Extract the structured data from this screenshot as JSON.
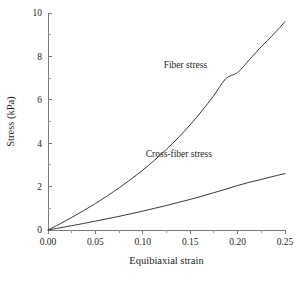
{
  "chart_data": {
    "type": "line",
    "title": "",
    "xlabel": "Equibiaxial strain",
    "ylabel": "Stress (kPa)",
    "xlim": [
      0.0,
      0.25
    ],
    "ylim": [
      0.0,
      10.0
    ],
    "grid": false,
    "legend_position": "inline-annotation",
    "xticks": [
      0.0,
      0.05,
      0.1,
      0.15,
      0.2,
      0.25
    ],
    "xtick_labels": [
      "0.00",
      "0.05",
      "0.10",
      "0.15",
      "0.20",
      "0.25"
    ],
    "xticks_minor": [
      0.025,
      0.075,
      0.125,
      0.175,
      0.225
    ],
    "yticks": [
      0,
      2,
      4,
      6,
      8,
      10
    ],
    "ytick_labels": [
      "0",
      "2",
      "4",
      "6",
      "8",
      "10"
    ],
    "yticks_minor": [
      1,
      3,
      5,
      7,
      9
    ],
    "x": [
      0.0,
      0.0125,
      0.025,
      0.0375,
      0.05,
      0.0625,
      0.075,
      0.0875,
      0.1,
      0.1125,
      0.125,
      0.1375,
      0.15,
      0.1625,
      0.175,
      0.1875,
      0.2,
      0.2125,
      0.225,
      0.2375,
      0.25
    ],
    "series": [
      {
        "name": "Fiber stress",
        "color": "#3a3a3a",
        "values": [
          0.0,
          0.28,
          0.58,
          0.89,
          1.22,
          1.57,
          1.94,
          2.34,
          2.76,
          3.22,
          3.72,
          4.26,
          4.85,
          5.5,
          6.2,
          6.97,
          7.26,
          7.85,
          8.45,
          9.0,
          9.6
        ],
        "annotation": {
          "text": "Fiber stress",
          "x": 0.145,
          "y": 7.45
        }
      },
      {
        "name": "Cross-fiber stress",
        "color": "#3a3a3a",
        "values": [
          0.0,
          0.1,
          0.2,
          0.3,
          0.41,
          0.52,
          0.63,
          0.75,
          0.87,
          1.0,
          1.13,
          1.27,
          1.41,
          1.56,
          1.72,
          1.88,
          2.05,
          2.2,
          2.33,
          2.47,
          2.6
        ],
        "annotation": {
          "text": "Cross-fiber stress",
          "x": 0.138,
          "y": 3.35
        }
      }
    ]
  }
}
